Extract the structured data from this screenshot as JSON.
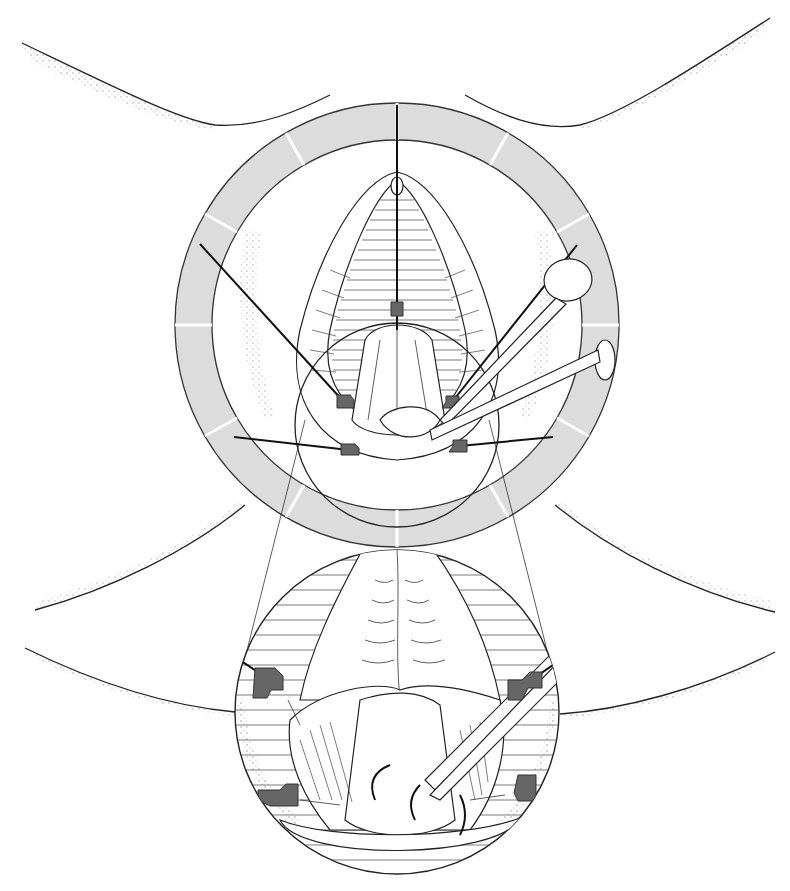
{
  "figure": {
    "colors": {
      "background": "#ffffff",
      "line": "#222222",
      "ring_fill": "#dcdcdc",
      "hook_fill": "#666666"
    },
    "ring": {
      "cx": 397,
      "cy": 325,
      "outer_r": 222,
      "inner_r": 185,
      "segments": 12
    },
    "inset": {
      "cx": 397,
      "cy": 712,
      "r": 162
    },
    "top_hooks": [
      {
        "x": 343,
        "y": 401
      },
      {
        "x": 452,
        "y": 402
      },
      {
        "x": 349,
        "y": 450
      },
      {
        "x": 460,
        "y": 446
      },
      {
        "x": 397,
        "y": 309
      }
    ],
    "inset_hooks": [
      {
        "x": 270,
        "y": 680
      },
      {
        "x": 520,
        "y": 688
      },
      {
        "x": 278,
        "y": 795
      },
      {
        "x": 527,
        "y": 787
      }
    ]
  }
}
